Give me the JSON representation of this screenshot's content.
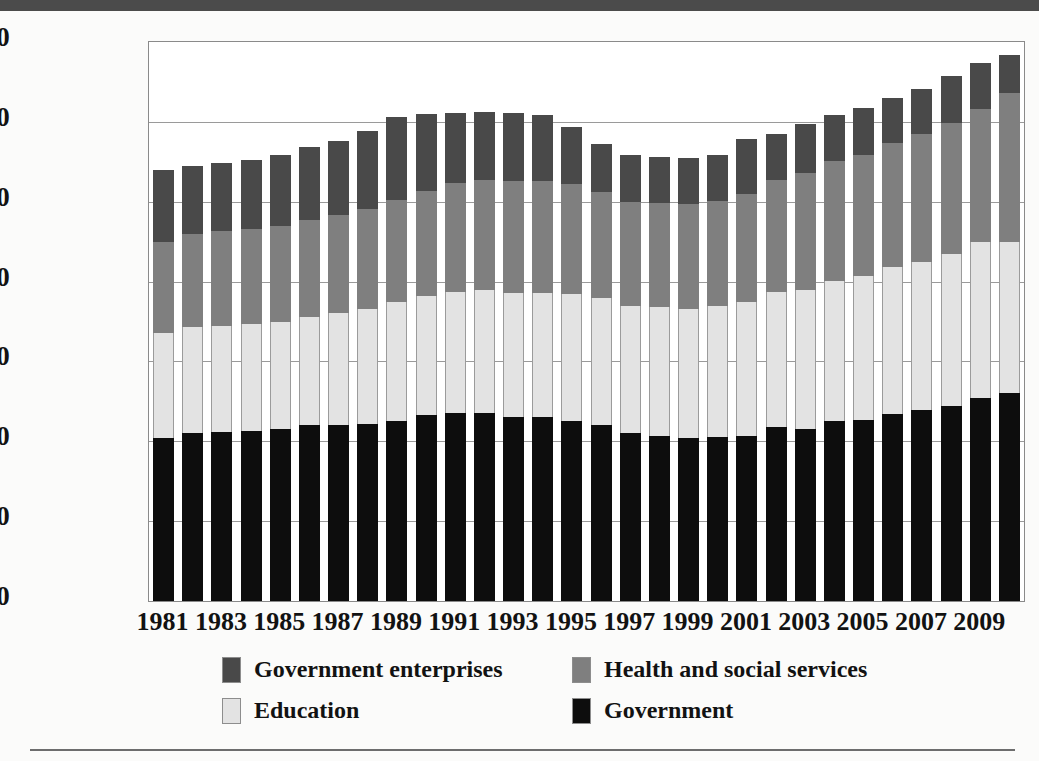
{
  "page": {
    "top_band_color": "#4b4b4b",
    "background_color": "#fbfbfa",
    "rule_color": "#6d6d6d"
  },
  "legend": {
    "position": "bottom",
    "items": [
      {
        "label": "Government enterprises",
        "color": "#494949",
        "key": "enterprises"
      },
      {
        "label": "Health and social services",
        "color": "#7f7f7f",
        "key": "health"
      },
      {
        "label": "Education",
        "color": "#e3e3e3",
        "key": "education"
      },
      {
        "label": "Government",
        "color": "#0d0d0d",
        "key": "government"
      }
    ]
  },
  "chart_data": {
    "type": "bar",
    "stacked": true,
    "title": "",
    "subtitle": "",
    "xlabel": "",
    "ylabel": "",
    "grid": true,
    "legend_position": "bottom",
    "ylim": [
      0,
      3500000
    ],
    "ytick_labels": [
      "3,500,000",
      "3,000,000",
      "2,500,000",
      "2,000,000",
      "1,500,000",
      "1,000,000",
      "500,000",
      "0"
    ],
    "ytick_values": [
      3500000,
      3000000,
      2500000,
      2000000,
      1500000,
      1000000,
      500000,
      0
    ],
    "categories": [
      "1981",
      "1982",
      "1983",
      "1984",
      "1985",
      "1986",
      "1987",
      "1988",
      "1989",
      "1990",
      "1991",
      "1992",
      "1993",
      "1994",
      "1995",
      "1996",
      "1997",
      "1998",
      "1999",
      "2000",
      "2001",
      "2002",
      "2003",
      "2004",
      "2005",
      "2006",
      "2007",
      "2008",
      "2009",
      "2010"
    ],
    "xtick_labels": [
      "1981",
      "1983",
      "1985",
      "1987",
      "1989",
      "1991",
      "1993",
      "1995",
      "1997",
      "1999",
      "2001",
      "2003",
      "2005",
      "2007",
      "2009"
    ],
    "xtick_categories": [
      "1981",
      "1983",
      "1985",
      "1987",
      "1989",
      "1991",
      "1993",
      "1995",
      "1997",
      "1999",
      "2001",
      "2003",
      "2005",
      "2007",
      "2009"
    ],
    "series": [
      {
        "name": "Government",
        "color": "#0d0d0d",
        "values": [
          1020000,
          1050000,
          1060000,
          1065000,
          1075000,
          1100000,
          1105000,
          1110000,
          1130000,
          1165000,
          1175000,
          1175000,
          1155000,
          1150000,
          1130000,
          1105000,
          1050000,
          1035000,
          1020000,
          1025000,
          1035000,
          1090000,
          1080000,
          1125000,
          1135000,
          1170000,
          1195000,
          1220000,
          1270000,
          1300000
        ]
      },
      {
        "name": "Education",
        "color": "#e3e3e3",
        "values": [
          660000,
          665000,
          665000,
          670000,
          675000,
          680000,
          700000,
          720000,
          740000,
          745000,
          760000,
          770000,
          775000,
          780000,
          790000,
          795000,
          800000,
          805000,
          810000,
          820000,
          835000,
          845000,
          870000,
          880000,
          900000,
          920000,
          930000,
          955000,
          980000,
          950000
        ]
      },
      {
        "name": "Health and social services",
        "color": "#7f7f7f",
        "values": [
          570000,
          580000,
          590000,
          595000,
          600000,
          605000,
          615000,
          625000,
          640000,
          660000,
          680000,
          690000,
          700000,
          700000,
          690000,
          660000,
          650000,
          650000,
          655000,
          660000,
          680000,
          700000,
          730000,
          750000,
          760000,
          780000,
          800000,
          820000,
          830000,
          930000
        ]
      },
      {
        "name": "Government enterprises",
        "color": "#494949",
        "values": [
          450000,
          430000,
          430000,
          430000,
          440000,
          455000,
          460000,
          490000,
          520000,
          480000,
          440000,
          425000,
          425000,
          415000,
          360000,
          300000,
          290000,
          290000,
          290000,
          290000,
          340000,
          290000,
          310000,
          290000,
          290000,
          280000,
          280000,
          290000,
          290000,
          240000
        ]
      }
    ],
    "totals": [
      2700000,
      2725000,
      2745000,
      2760000,
      2790000,
      2840000,
      2880000,
      2945000,
      3030000,
      3050000,
      3055000,
      3060000,
      3055000,
      3045000,
      2970000,
      2860000,
      2790000,
      2780000,
      2775000,
      2795000,
      2890000,
      2925000,
      2990000,
      3045000,
      3085000,
      3150000,
      3205000,
      3285000,
      3370000,
      3420000
    ]
  }
}
